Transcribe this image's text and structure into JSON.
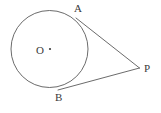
{
  "figure": {
    "type": "geometry-diagram",
    "background_color": "#ffffff",
    "stroke_color": "#5a5a5a",
    "label_color": "#3a3a3a",
    "stroke_width": 0.9,
    "canvas": {
      "width": 161,
      "height": 113
    }
  },
  "labels": {
    "center": "O",
    "tangent_point_upper": "A",
    "tangent_point_lower": "B",
    "external_point": "P"
  },
  "geometry": {
    "circle": {
      "cx": 49.5,
      "cy": 49,
      "r": 38.5
    },
    "center_dot": {
      "cx": 50,
      "cy": 49,
      "r": 1.1
    },
    "points": {
      "A": {
        "x": 76,
        "y": 18
      },
      "B": {
        "x": 58,
        "y": 90
      },
      "P": {
        "x": 139.5,
        "y": 68
      },
      "O": {
        "x": 50,
        "y": 49
      }
    },
    "segments": [
      {
        "name": "tangent-AP",
        "x1": 76,
        "y1": 18,
        "x2": 139.5,
        "y2": 68
      },
      {
        "name": "tangent-BP",
        "x1": 58,
        "y1": 90,
        "x2": 139.5,
        "y2": 68
      }
    ]
  }
}
